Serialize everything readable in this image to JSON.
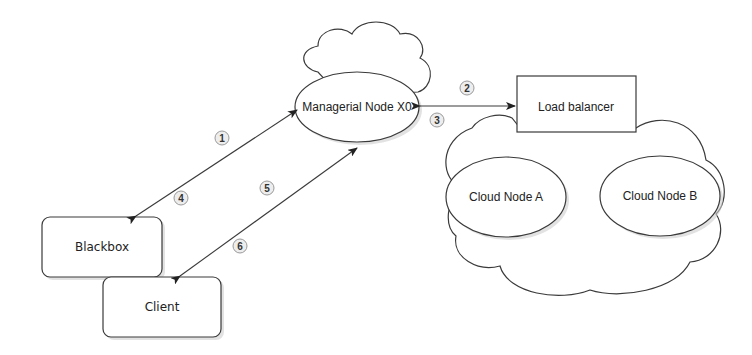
{
  "diagram": {
    "nodes": {
      "managerial": {
        "label": "Managerial Node X0"
      },
      "load_balancer": {
        "label": "Load balancer"
      },
      "cloud_a": {
        "label": "Cloud Node A"
      },
      "cloud_b": {
        "label": "Cloud Node B"
      },
      "blackbox": {
        "label": "Blackbox"
      },
      "client": {
        "label": "Client"
      }
    },
    "steps": [
      {
        "n": "1"
      },
      {
        "n": "2"
      },
      {
        "n": "3"
      },
      {
        "n": "4"
      },
      {
        "n": "5"
      },
      {
        "n": "6"
      }
    ],
    "edges": [
      {
        "from": "Blackbox",
        "to": "Managerial Node X0",
        "steps": "1,4",
        "bidirectional": true
      },
      {
        "from": "Managerial Node X0",
        "to": "Load balancer",
        "steps": "2,3",
        "bidirectional": true
      },
      {
        "from": "Client",
        "to": "Managerial Node X0",
        "steps": "5,6",
        "bidirectional": true
      }
    ],
    "colors": {
      "stroke": "#3a3a3a",
      "badge_fill": "#ededed",
      "background": "#ffffff"
    }
  }
}
